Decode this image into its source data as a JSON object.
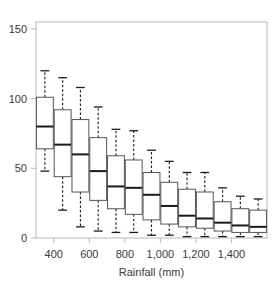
{
  "figure": {
    "title_partial": "",
    "background_color": "#ffffff",
    "frame_color": "#b8b8b8",
    "ink_color": "#1a1a1a"
  },
  "chart_data": {
    "type": "box",
    "title": "",
    "xlabel": "Rainfall (mm)",
    "ylabel": "",
    "xlim": [
      300,
      1600
    ],
    "ylim": [
      0,
      155
    ],
    "grid": false,
    "legend": null,
    "xticks": [
      400,
      600,
      800,
      1000,
      1200,
      1400
    ],
    "xticklabels": [
      "400",
      "600",
      "800",
      "1,000",
      "1,200",
      "1,400"
    ],
    "yticks": [
      0,
      50,
      100,
      150
    ],
    "yticklabels": [
      "0",
      "50",
      "100",
      "150"
    ],
    "categories": [
      350,
      450,
      550,
      650,
      750,
      850,
      950,
      1050,
      1150,
      1250,
      1350,
      1450,
      1550
    ],
    "boxes": [
      {
        "x": 350,
        "whislo": 48,
        "q1": 64,
        "median": 80,
        "q3": 101,
        "whishi": 120
      },
      {
        "x": 450,
        "whislo": 20,
        "q1": 44,
        "median": 67,
        "q3": 92,
        "whishi": 115
      },
      {
        "x": 550,
        "whislo": 8,
        "q1": 33,
        "median": 60,
        "q3": 85,
        "whishi": 108
      },
      {
        "x": 650,
        "whislo": 5,
        "q1": 27,
        "median": 48,
        "q3": 72,
        "whishi": 94
      },
      {
        "x": 750,
        "whislo": 4,
        "q1": 21,
        "median": 37,
        "q3": 59,
        "whishi": 78
      },
      {
        "x": 850,
        "whislo": 4,
        "q1": 17,
        "median": 36,
        "q3": 56,
        "whishi": 77
      },
      {
        "x": 950,
        "whislo": 2,
        "q1": 13,
        "median": 31,
        "q3": 47,
        "whishi": 63
      },
      {
        "x": 1050,
        "whislo": 2,
        "q1": 10,
        "median": 23,
        "q3": 40,
        "whishi": 55
      },
      {
        "x": 1150,
        "whislo": 1,
        "q1": 8,
        "median": 16,
        "q3": 35,
        "whishi": 47
      },
      {
        "x": 1250,
        "whislo": 1,
        "q1": 7,
        "median": 14,
        "q3": 33,
        "whishi": 47
      },
      {
        "x": 1350,
        "whislo": 1,
        "q1": 5,
        "median": 11,
        "q3": 26,
        "whishi": 36
      },
      {
        "x": 1450,
        "whislo": 1,
        "q1": 4,
        "median": 9,
        "q3": 21,
        "whishi": 30
      },
      {
        "x": 1550,
        "whislo": 1,
        "q1": 4,
        "median": 8,
        "q3": 20,
        "whishi": 28
      }
    ]
  }
}
